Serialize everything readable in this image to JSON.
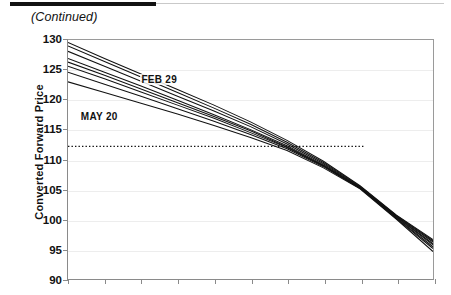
{
  "page": {
    "continued_caption": "(Continued)"
  },
  "chart_data": {
    "type": "line",
    "title": "",
    "xlabel": "",
    "ylabel": "Converted Forward Price",
    "ylim": [
      90,
      130
    ],
    "yticks": [
      130,
      125,
      120,
      115,
      110,
      105,
      100,
      95,
      90
    ],
    "grid": true,
    "legend_position": "inline-annotations",
    "x_tick_count": 11,
    "x_tick_labels": [],
    "xlim": [
      0,
      10
    ],
    "annotations": [
      {
        "text": "FEB 29",
        "x": 2.0,
        "y": 123.2
      },
      {
        "text": "MAY 20",
        "x": 0.35,
        "y": 117.0
      }
    ],
    "reference_line": {
      "type": "horizontal-dotted",
      "value": 112.2,
      "x_start": 0,
      "x_end": 8.1,
      "label": ""
    },
    "x": [
      0,
      1,
      2,
      3,
      4,
      5,
      6,
      7,
      8,
      9,
      10
    ],
    "series": [
      {
        "name": "FEB 29",
        "values": [
          129.6,
          126.9,
          124.3,
          121.7,
          119.1,
          116.3,
          113.2,
          109.7,
          105.6,
          100.7,
          96.6
        ]
      },
      {
        "name": "line-2",
        "values": [
          129.0,
          126.4,
          123.8,
          121.2,
          118.6,
          115.9,
          112.9,
          109.5,
          105.5,
          100.6,
          96.4
        ]
      },
      {
        "name": "line-3",
        "values": [
          128.1,
          125.6,
          123.1,
          120.6,
          118.1,
          115.5,
          112.6,
          109.3,
          105.4,
          100.5,
          96.2
        ]
      },
      {
        "name": "line-4",
        "values": [
          126.9,
          124.6,
          122.3,
          119.9,
          117.5,
          115.0,
          112.3,
          109.1,
          105.3,
          100.4,
          95.9
        ]
      },
      {
        "name": "line-5",
        "values": [
          126.3,
          124.1,
          121.8,
          119.5,
          117.2,
          114.8,
          112.1,
          109.0,
          105.3,
          100.3,
          95.7
        ]
      },
      {
        "name": "line-6",
        "values": [
          125.6,
          123.5,
          121.3,
          119.1,
          116.9,
          114.5,
          112.0,
          108.9,
          105.2,
          100.2,
          95.4
        ]
      },
      {
        "name": "line-7",
        "values": [
          124.6,
          122.6,
          120.6,
          118.5,
          116.4,
          114.2,
          111.8,
          108.8,
          105.2,
          100.1,
          95.1
        ]
      },
      {
        "name": "MAY 20",
        "values": [
          123.0,
          121.2,
          119.4,
          117.6,
          115.7,
          113.7,
          111.5,
          108.6,
          105.1,
          100.0,
          94.6
        ]
      }
    ]
  },
  "colors": {
    "line": "#111111",
    "grid": "#ededed",
    "axis": "#8a8a8a",
    "text": "#111111",
    "rule": "#121212"
  }
}
